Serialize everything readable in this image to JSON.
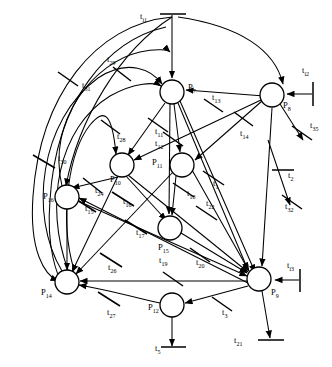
{
  "diagram": {
    "type": "petri-net",
    "width": 332,
    "height": 367,
    "stroke_color": "#000000",
    "fill_color": "#ffffff",
    "places": [
      {
        "id": "P7",
        "label": "P",
        "sub": "7",
        "cx": 172,
        "cy": 92,
        "r": 12,
        "label_x": 188,
        "label_y": 90
      },
      {
        "id": "P8",
        "label": "P",
        "sub": "8",
        "cx": 272,
        "cy": 95,
        "r": 12,
        "label_x": 283,
        "label_y": 108
      },
      {
        "id": "P10",
        "label": "P",
        "sub": "10",
        "cx": 122,
        "cy": 165,
        "r": 12,
        "label_x": 110,
        "label_y": 182
      },
      {
        "id": "P11",
        "label": "P",
        "sub": "11",
        "cx": 182,
        "cy": 165,
        "r": 12,
        "label_x": 152,
        "label_y": 165
      },
      {
        "id": "P16",
        "label": "P",
        "sub": "16",
        "cx": 67,
        "cy": 197,
        "r": 12,
        "label_x": 43,
        "label_y": 199
      },
      {
        "id": "P15",
        "label": "P",
        "sub": "15",
        "cx": 170,
        "cy": 228,
        "r": 12,
        "label_x": 158,
        "label_y": 250
      },
      {
        "id": "P14",
        "label": "P",
        "sub": "14",
        "cx": 67,
        "cy": 282,
        "r": 12,
        "label_x": 41,
        "label_y": 295
      },
      {
        "id": "P9",
        "label": "P",
        "sub": "9",
        "cx": 259,
        "cy": 279,
        "r": 12,
        "label_x": 271,
        "label_y": 295
      },
      {
        "id": "P12",
        "label": "P",
        "sub": "12",
        "cx": 172,
        "cy": 305,
        "r": 12,
        "label_x": 148,
        "label_y": 310
      }
    ],
    "transitions": [
      {
        "id": "ti1",
        "label": "t",
        "sub": "i1",
        "label_x": 140,
        "label_y": 19,
        "bar_x1": 160,
        "bar_y1": 14,
        "bar_x2": 185,
        "bar_y2": 14,
        "angle": 0
      },
      {
        "id": "ti2",
        "label": "t",
        "sub": "i2",
        "label_x": 302,
        "label_y": 73,
        "bar_x1": 313,
        "bar_y1": 82,
        "bar_x2": 313,
        "bar_y2": 105,
        "angle": 90
      },
      {
        "id": "ti3",
        "label": "t",
        "sub": "i3",
        "label_x": 287,
        "label_y": 268,
        "bar_x1": 300,
        "bar_y1": 270,
        "bar_x2": 300,
        "bar_y2": 292,
        "angle": 90
      },
      {
        "id": "t1",
        "label": "t",
        "sub": "1",
        "label_x": 213,
        "label_y": 186
      },
      {
        "id": "t2",
        "label": "t",
        "sub": "2",
        "label_x": 288,
        "label_y": 178
      },
      {
        "id": "t3",
        "label": "t",
        "sub": "3",
        "label_x": 222,
        "label_y": 315
      },
      {
        "id": "t5",
        "label": "t",
        "sub": "5",
        "label_x": 155,
        "label_y": 351
      },
      {
        "id": "t11",
        "label": "t",
        "sub": "11",
        "label_x": 155,
        "label_y": 134
      },
      {
        "id": "t12",
        "label": "t",
        "sub": "12",
        "label_x": 155,
        "label_y": 146
      },
      {
        "id": "t13",
        "label": "t",
        "sub": "13",
        "label_x": 212,
        "label_y": 100
      },
      {
        "id": "t14",
        "label": "t",
        "sub": "14",
        "label_x": 240,
        "label_y": 136
      },
      {
        "id": "t15",
        "label": "t",
        "sub": "15",
        "label_x": 85,
        "label_y": 211
      },
      {
        "id": "t16",
        "label": "t",
        "sub": "16",
        "label_x": 123,
        "label_y": 204
      },
      {
        "id": "t17",
        "label": "t",
        "sub": "17",
        "label_x": 136,
        "label_y": 235
      },
      {
        "id": "t18",
        "label": "t",
        "sub": "18",
        "label_x": 187,
        "label_y": 196
      },
      {
        "id": "t19",
        "label": "t",
        "sub": "19",
        "label_x": 159,
        "label_y": 263
      },
      {
        "id": "t20",
        "label": "t",
        "sub": "20",
        "label_x": 196,
        "label_y": 265
      },
      {
        "id": "t21",
        "label": "t",
        "sub": "21",
        "label_x": 234,
        "label_y": 343
      },
      {
        "id": "t22",
        "label": "t",
        "sub": "22",
        "label_x": 206,
        "label_y": 206
      },
      {
        "id": "t24",
        "label": "t",
        "sub": "24",
        "label_x": 95,
        "label_y": 193
      },
      {
        "id": "t26",
        "label": "t",
        "sub": "26",
        "label_x": 108,
        "label_y": 270
      },
      {
        "id": "t27",
        "label": "t",
        "sub": "27",
        "label_x": 107,
        "label_y": 315
      },
      {
        "id": "t28",
        "label": "t",
        "sub": "28",
        "label_x": 117,
        "label_y": 139
      },
      {
        "id": "t29",
        "label": "t",
        "sub": "29",
        "label_x": 107,
        "label_y": 62
      },
      {
        "id": "t30",
        "label": "t",
        "sub": "30",
        "label_x": 58,
        "label_y": 161
      },
      {
        "id": "t31",
        "label": "t",
        "sub": "31",
        "label_x": 82,
        "label_y": 88
      },
      {
        "id": "t32",
        "label": "t",
        "sub": "32",
        "label_x": 285,
        "label_y": 209
      },
      {
        "id": "t35",
        "label": "t",
        "sub": "35",
        "label_x": 310,
        "label_y": 128
      }
    ]
  }
}
